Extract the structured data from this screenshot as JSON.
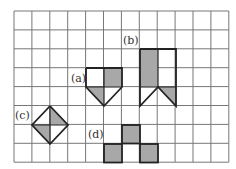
{
  "grid": {
    "columns": 12,
    "rows": 8,
    "origin_x": 14,
    "origin_y": 11,
    "cell_w": 17.9,
    "cell_h": 18.9,
    "line_color": "#777777",
    "shade_color": "#a8a8a8",
    "outline_color": "#222222"
  },
  "labels": [
    {
      "id": "a",
      "text": "(a)",
      "x": 71,
      "y": 73
    },
    {
      "id": "b",
      "text": "(b)",
      "x": 123,
      "y": 35
    },
    {
      "id": "c",
      "text": "(c)",
      "x": 15,
      "y": 110
    },
    {
      "id": "d",
      "text": "(d)",
      "x": 88,
      "y": 129
    }
  ],
  "figures": {
    "a": {
      "outline": [
        [
          86,
          68
        ],
        [
          122,
          68
        ],
        [
          122,
          87
        ],
        [
          104,
          106
        ],
        [
          86,
          87
        ],
        [
          86,
          68
        ]
      ],
      "inner_lines": [
        [
          [
            104,
            68
          ],
          [
            104,
            106
          ]
        ],
        [
          [
            86,
            87
          ],
          [
            122,
            87
          ]
        ]
      ],
      "shaded": [
        [
          [
            104,
            68
          ],
          [
            122,
            68
          ],
          [
            122,
            87
          ],
          [
            104,
            87
          ]
        ],
        [
          [
            86,
            87
          ],
          [
            104,
            87
          ],
          [
            104,
            106
          ]
        ]
      ]
    },
    "b": {
      "outline": [
        [
          140,
          49
        ],
        [
          176,
          49
        ],
        [
          176,
          106
        ],
        [
          158,
          87
        ],
        [
          140,
          106
        ],
        [
          140,
          49
        ]
      ],
      "inner_lines": [
        [
          [
            158,
            49
          ],
          [
            158,
            87
          ]
        ],
        [
          [
            140,
            87
          ],
          [
            176,
            87
          ]
        ]
      ],
      "shaded": [
        [
          [
            140,
            49
          ],
          [
            158,
            49
          ],
          [
            158,
            87
          ],
          [
            140,
            87
          ]
        ],
        [
          [
            158,
            87
          ],
          [
            176,
            87
          ],
          [
            176,
            106
          ]
        ]
      ]
    },
    "c": {
      "outline": [
        [
          50,
          106
        ],
        [
          68,
          125
        ],
        [
          50,
          144
        ],
        [
          32,
          125
        ],
        [
          50,
          106
        ]
      ],
      "inner_lines": [
        [
          [
            50,
            106
          ],
          [
            50,
            144
          ]
        ],
        [
          [
            32,
            125
          ],
          [
            68,
            125
          ]
        ]
      ],
      "shaded": [
        [
          [
            50,
            106
          ],
          [
            68,
            125
          ],
          [
            50,
            125
          ]
        ],
        [
          [
            32,
            125
          ],
          [
            50,
            125
          ],
          [
            50,
            144
          ]
        ]
      ]
    },
    "d": {
      "cells": [
        [
          122,
          125
        ],
        [
          104,
          144
        ],
        [
          140,
          144
        ]
      ],
      "cell_w": 18,
      "cell_h": 18.5
    }
  }
}
